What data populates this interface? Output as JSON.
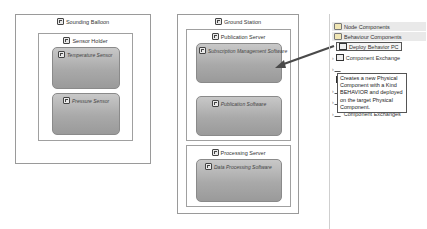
{
  "diagram_left": {
    "title": "Sounding Balloon",
    "child": {
      "title": "Sensor Holder",
      "components": [
        {
          "label": "Temperature Sensor"
        },
        {
          "label": "Pressure Sensor"
        }
      ]
    }
  },
  "diagram_middle": {
    "title": "Ground Station",
    "servers": [
      {
        "title": "Publication Server",
        "components": [
          {
            "label": "Subscription Management Software"
          },
          {
            "label": "Publication Software"
          }
        ]
      },
      {
        "title": "Processing Server",
        "components": [
          {
            "label": "Data Processing Software"
          }
        ]
      }
    ]
  },
  "palette": {
    "drawers": [
      {
        "label": "Node Components"
      },
      {
        "label": "Behaviour Components"
      }
    ],
    "items": [
      {
        "label": "Deploy Behavior PC",
        "selected": true
      },
      {
        "label": "Component Exchange"
      },
      {
        "label": "Deployed PCs"
      },
      {
        "label": "Component Exchanges"
      }
    ],
    "tooltip": "Creates a new Physical Component with a Kind BEHAVIOR and deployed on the target Physical Component."
  },
  "colors": {
    "component_fill": "#a9a9a9",
    "arrow": "#4a4a4a"
  }
}
